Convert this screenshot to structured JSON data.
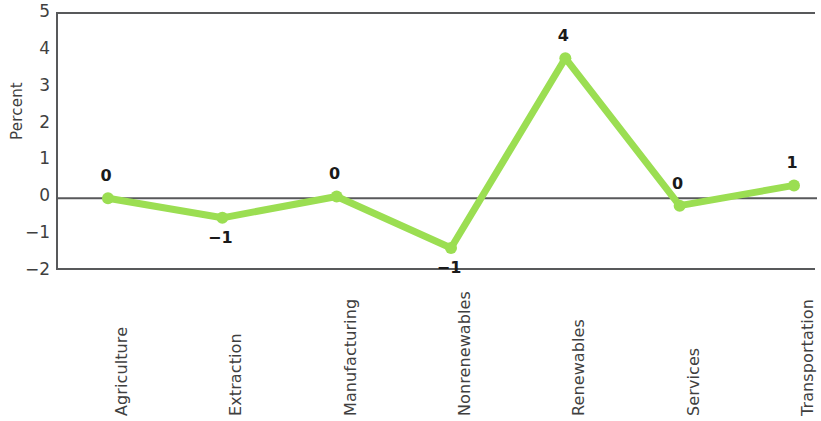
{
  "chart_data": {
    "type": "line",
    "title": "",
    "subtitle": "",
    "xlabel": "",
    "ylabel": "Percent",
    "categories": [
      "Agriculture",
      "Extraction",
      "Manufacturing",
      "Nonrenewables",
      "Renewables",
      "Services",
      "Transportation"
    ],
    "values": [
      0.0,
      -0.53,
      0.05,
      -1.35,
      3.8,
      -0.2,
      0.35
    ],
    "point_labels": [
      "0",
      "−1",
      "0",
      "−1",
      "4",
      "0",
      "1"
    ],
    "ylim": [
      -2,
      5
    ],
    "y_ticks": [
      5,
      4,
      3,
      2,
      1,
      0,
      -1,
      -2
    ],
    "y_tick_labels": [
      "5",
      "4",
      "3",
      "2",
      "1",
      "0",
      "−1",
      "−2"
    ],
    "grid": false,
    "legend": "none",
    "series": [
      {
        "name": "Percent change",
        "values": [
          0.0,
          -0.53,
          0.05,
          -1.35,
          3.8,
          -0.2,
          0.35
        ]
      }
    ],
    "colors": {
      "line": "#9BDE52",
      "marker": "#9BDE52",
      "axis": "#58595b",
      "zero_line": "#58595b",
      "text": "#3f3f3f",
      "label_text": "#1a1a1a",
      "background": "#ffffff"
    },
    "style": {
      "line_width": 7,
      "marker_radius": 6,
      "x_label_rotation": -90
    }
  }
}
